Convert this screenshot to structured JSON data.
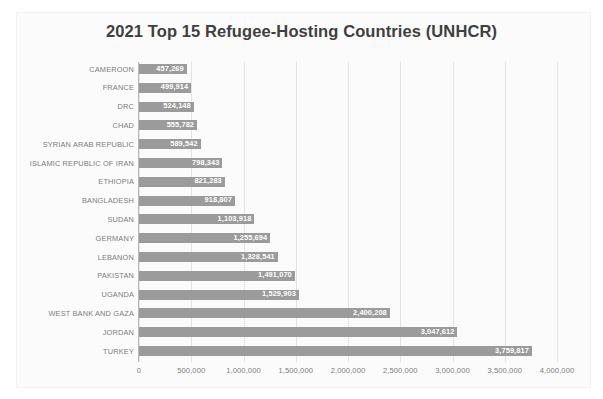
{
  "chart_data": {
    "type": "bar",
    "orientation": "horizontal",
    "title": "2021 Top 15 Refugee-Hosting Countries (UNHCR)",
    "xlabel": "",
    "ylabel": "",
    "xlim": [
      0,
      4000000
    ],
    "grid": true,
    "legend": "none",
    "bar_color": "#9b9b9b",
    "label_color": "#7b7b7b",
    "title_color": "#3f3f3f",
    "value_label_color": "#ffffff",
    "xticks": [
      "0",
      "500,000",
      "1,000,000",
      "1,500,000",
      "2,000,000",
      "2,500,000",
      "3,000,000",
      "3,500,000",
      "4,000,000"
    ],
    "xtick_values": [
      0,
      500000,
      1000000,
      1500000,
      2000000,
      2500000,
      3000000,
      3500000,
      4000000
    ],
    "categories": [
      "CAMEROON",
      "FRANCE",
      "DRC",
      "CHAD",
      "SYRIAN ARAB REPUBLIC",
      "ISLAMIC REPUBLIC OF IRAN",
      "ETHIOPIA",
      "BANGLADESH",
      "SUDAN",
      "GERMANY",
      "LEBANON",
      "PAKISTAN",
      "UGANDA",
      "WEST BANK AND GAZA",
      "JORDAN",
      "TURKEY"
    ],
    "values": [
      457269,
      499914,
      524148,
      555782,
      589542,
      798343,
      821283,
      918807,
      1103918,
      1255694,
      1328541,
      1491070,
      1529903,
      2400208,
      3047612,
      3759817
    ],
    "value_labels": [
      "457,269",
      "499,914",
      "524,148",
      "555,782",
      "589,542",
      "798,343",
      "821,283",
      "918,807",
      "1,103,918",
      "1,255,694",
      "1,328,541",
      "1,491,070",
      "1,529,903",
      "2,400,208",
      "3,047,612",
      "3,759,817"
    ]
  }
}
